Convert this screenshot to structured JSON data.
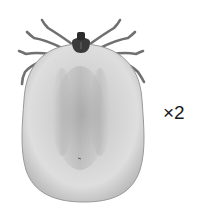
{
  "figure": {
    "scale_label": "×2",
    "colors": {
      "background": "#ffffff",
      "body_light": "#e2e2e2",
      "body_mid": "#c8c8c8",
      "body_dark": "#a9a9a9",
      "head": "#3c3c3c",
      "legs": "#6e6e6e"
    }
  }
}
